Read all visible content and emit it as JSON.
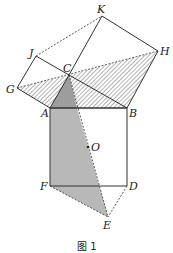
{
  "figure": {
    "caption": "图 1",
    "points": {
      "A": {
        "label": "A",
        "x": 50,
        "y": 108
      },
      "B": {
        "label": "B",
        "x": 127,
        "y": 108
      },
      "C": {
        "label": "C",
        "x": 69,
        "y": 75
      },
      "D": {
        "label": "D",
        "x": 127,
        "y": 186
      },
      "E": {
        "label": "E",
        "x": 108,
        "y": 217
      },
      "F": {
        "label": "F",
        "x": 50,
        "y": 186
      },
      "G": {
        "label": "G",
        "x": 17,
        "y": 88
      },
      "H": {
        "label": "H",
        "x": 158,
        "y": 51
      },
      "J": {
        "label": "J",
        "x": 36,
        "y": 56
      },
      "K": {
        "label": "K",
        "x": 102,
        "y": 16
      },
      "O": {
        "label": "O",
        "x": 88,
        "y": 147
      }
    },
    "colors": {
      "line": "#333333",
      "gray_fill": "#b8b8b8",
      "hatch": "#555555"
    }
  }
}
